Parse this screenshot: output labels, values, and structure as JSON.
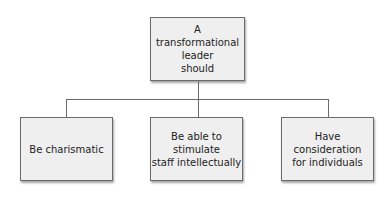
{
  "diagram": {
    "type": "hierarchy",
    "root": {
      "label": "A transformational\nleader\nshould"
    },
    "children": [
      {
        "label": "Be charismatic"
      },
      {
        "label": "Be able to stimulate\nstaff intellectually"
      },
      {
        "label": "Have consideration\nfor individuals"
      }
    ],
    "colors": {
      "box_fill": "#efefef",
      "border": "#6a6a6a",
      "connector": "#6a6a6a"
    }
  }
}
